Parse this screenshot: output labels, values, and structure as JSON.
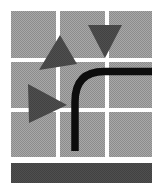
{
  "canvas": {
    "width": 163,
    "height": 190,
    "background": "#ffffff",
    "title": "Abstract grid logo with triangles, elbow pipe and bar"
  },
  "colors": {
    "background": "#ffffff",
    "tile_gray": "#9e9e9e",
    "tile_dither_light": "#c8c8c8",
    "tile_dither_dark": "#7a7a7a",
    "triangle_dark": "#4a4a4a",
    "pipe_black": "#0d0d0d",
    "bar_dark": "#4a4a4a",
    "gutter": "#ffffff"
  },
  "grid": {
    "name": "tile-grid",
    "rows": 3,
    "columns": 3,
    "left": 11,
    "top": 11,
    "right": 152,
    "bottom": 157,
    "gutter": 4,
    "column_x": [
      11,
      60,
      109
    ],
    "column_width": [
      45,
      45,
      43
    ],
    "row_y": [
      11,
      62,
      112
    ],
    "row_height": [
      47,
      46,
      45
    ],
    "tiles": [
      {
        "id": "tile-r1c1",
        "x": 11,
        "y": 11,
        "w": 45,
        "h": 47
      },
      {
        "id": "tile-r1c2",
        "x": 60,
        "y": 11,
        "w": 45,
        "h": 47
      },
      {
        "id": "tile-r1c3",
        "x": 109,
        "y": 11,
        "w": 43,
        "h": 47
      },
      {
        "id": "tile-r2c1",
        "x": 11,
        "y": 62,
        "w": 45,
        "h": 46
      },
      {
        "id": "tile-r2c2",
        "x": 60,
        "y": 62,
        "w": 45,
        "h": 46
      },
      {
        "id": "tile-r2c3",
        "x": 109,
        "y": 62,
        "w": 43,
        "h": 46
      },
      {
        "id": "tile-r3c1",
        "x": 11,
        "y": 112,
        "w": 45,
        "h": 45
      },
      {
        "id": "tile-r3c2",
        "x": 60,
        "y": 112,
        "w": 45,
        "h": 45
      },
      {
        "id": "tile-r3c3",
        "x": 109,
        "y": 112,
        "w": 43,
        "h": 45
      }
    ]
  },
  "triangles": [
    {
      "id": "triangle-tilted-upper-left",
      "orientation": "tilted-down-left",
      "points": "60,35 77,64 39,70"
    },
    {
      "id": "triangle-down-upper-right",
      "orientation": "pointing-down",
      "points": "88,25 122,25 105,58"
    },
    {
      "id": "triangle-right-middle-left",
      "orientation": "pointing-right",
      "points": "28,84 67,105 29,123"
    }
  ],
  "pipe": {
    "id": "elbow-pipe",
    "description": "black elbow path from right edge curving down to bottom",
    "path": "M 152 71.5 L 104 71.5 Q 75 71.5 75 102 L 75 151",
    "stroke_width": 7.5,
    "color": "#0d0d0d",
    "start": [
      152,
      71.5
    ],
    "end": [
      75,
      151
    ]
  },
  "bar": {
    "id": "bottom-bar",
    "x": 11,
    "y": 163,
    "width": 141,
    "height": 20,
    "color": "#4a4a4a"
  }
}
